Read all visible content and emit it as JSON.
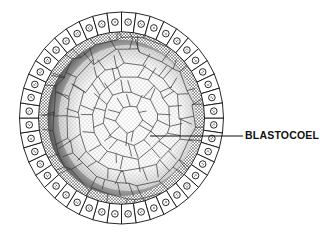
{
  "diagram": {
    "labels": [
      {
        "text": "BLASTOCOEL",
        "pointer_from": [
          150,
          136
        ],
        "pointer_to": [
          243,
          136
        ]
      }
    ],
    "geometry": {
      "center": [
        121.5,
        118
      ],
      "outer_rx": 102,
      "outer_ry": 106,
      "cell_layer_thickness": 19,
      "cell_count": 44
    },
    "colors": {
      "ink": "#111111",
      "background": "#ffffff",
      "cell_fill": "#ffffff",
      "dark_band": "#1a1a1a"
    }
  }
}
